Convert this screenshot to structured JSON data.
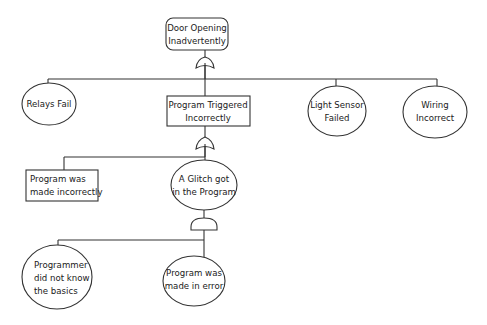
{
  "diagram": {
    "type": "fault-tree",
    "nodes": {
      "top_event": {
        "label_lines": [
          "Door Opening",
          "Inadvertently"
        ],
        "shape": "rounded-rectangle"
      },
      "relays_fail": {
        "label_lines": [
          "Relays Fail"
        ],
        "shape": "ellipse"
      },
      "program_triggered": {
        "label_lines": [
          "Program Triggered",
          "Incorrectly"
        ],
        "shape": "rectangle"
      },
      "light_sensor": {
        "label_lines": [
          "Light Sensor",
          "Failed"
        ],
        "shape": "ellipse"
      },
      "wiring": {
        "label_lines": [
          "Wiring",
          "Incorrect"
        ],
        "shape": "ellipse"
      },
      "program_made_incorrectly": {
        "label_lines": [
          "Program was",
          "made incorrectly"
        ],
        "shape": "rectangle"
      },
      "glitch": {
        "label_lines": [
          "A Glitch got",
          "in the Program"
        ],
        "shape": "ellipse"
      },
      "programmer_basics": {
        "label_lines": [
          "Programmer",
          "did not know",
          "the basics"
        ],
        "shape": "ellipse"
      },
      "program_error": {
        "label_lines": [
          "Program was",
          "made in error"
        ],
        "shape": "ellipse"
      }
    },
    "gates": [
      {
        "id": "gate-1",
        "type": "OR",
        "parent": "top_event",
        "children": [
          "relays_fail",
          "program_triggered",
          "light_sensor",
          "wiring"
        ]
      },
      {
        "id": "gate-2",
        "type": "OR",
        "parent": "program_triggered",
        "children": [
          "program_made_incorrectly",
          "glitch"
        ]
      },
      {
        "id": "gate-3",
        "type": "AND",
        "parent": "glitch",
        "children": [
          "programmer_basics",
          "program_error"
        ]
      }
    ],
    "colors": {
      "stroke": "#333333",
      "background": "#ffffff",
      "text": "#1a1a1a"
    }
  }
}
